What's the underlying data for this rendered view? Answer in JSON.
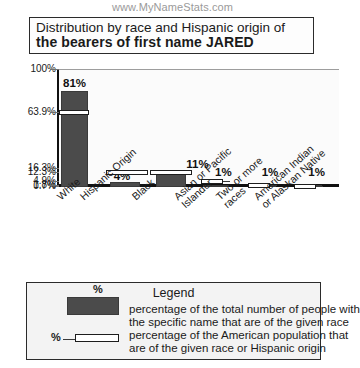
{
  "watermark": "www.MyNameStats.com",
  "title": {
    "line1": "Distribution by race and Hispanic origin of",
    "line2": "the bearers of first name JARED"
  },
  "legend": {
    "heading": "Legend",
    "solid_symbol": "%",
    "hollow_symbol": "%",
    "solid_desc_1": "percentage of the total number of people with",
    "solid_desc_2": "the specific name that are of the given race",
    "hollow_desc_1": "percentage of the American population that",
    "hollow_desc_2": "are of the given race or Hispanic origin"
  },
  "colors": {
    "solid_bar": "#4b4b4b",
    "hollow_bar_fill": "#ffffff",
    "outline": "#1d1d1d",
    "axis": "#111111",
    "gridline": "#9d9d9d",
    "plot_bg": "#fbfbfb",
    "legend_bg": "#f3f3f3",
    "watermark": "#9a9a9a"
  },
  "chart_data": {
    "type": "bar",
    "title": "Distribution by race and Hispanic origin of the bearers of first name JARED",
    "xlabel": "",
    "ylabel": "",
    "ylim": [
      0,
      100
    ],
    "grid": true,
    "legend_position": "bottom",
    "yticks": [
      0.7,
      1.8,
      4.9,
      12.3,
      16.3,
      63.9,
      100
    ],
    "ytick_labels": [
      "0.7%",
      "1.8%",
      "4.9%",
      "12.3%",
      "16.3%",
      "63.9%",
      "100%"
    ],
    "categories": [
      "White",
      "Hispanic Origin",
      "Black",
      "Asian or Pacific Islander",
      "Two or more races",
      "American Indian or Alaskan Native"
    ],
    "category_lines": [
      [
        "White"
      ],
      [
        "Hispanic Origin"
      ],
      [
        "Black"
      ],
      [
        "Asian or Pacific",
        "Islander"
      ],
      [
        "Two or more",
        "races"
      ],
      [
        "American Indian",
        "or Alaskan Native"
      ]
    ],
    "series": [
      {
        "name": "percentage of the total number of people with the specific name that are of the given race",
        "style": "solid",
        "values": [
          81,
          4,
          11,
          1,
          1,
          1
        ],
        "labels": [
          "81%",
          "4%",
          "11%",
          "1%",
          "1%",
          "1%"
        ]
      },
      {
        "name": "percentage of the American population that are of the given race or Hispanic origin",
        "style": "hollow",
        "values": [
          63.9,
          12.3,
          12.3,
          4.9,
          1.8,
          0.7
        ],
        "labels": [
          "63.9%",
          "12.3%",
          "12.3%",
          "4.9%",
          "1.8%",
          "0.7%"
        ]
      }
    ]
  }
}
